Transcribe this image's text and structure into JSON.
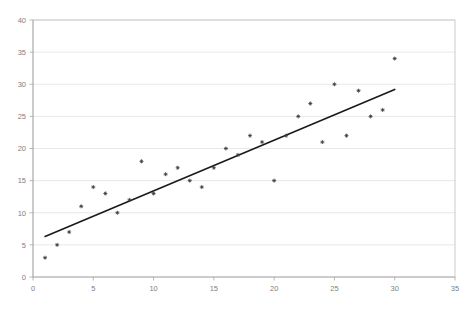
{
  "chart_data": {
    "type": "scatter",
    "title": "",
    "subtitle": "",
    "xlabel": "",
    "ylabel": "",
    "xlim": [
      0,
      35
    ],
    "ylim": [
      0,
      40
    ],
    "xticks": [
      0,
      5,
      10,
      15,
      20,
      25,
      30,
      35
    ],
    "yticks": [
      0,
      5,
      10,
      15,
      20,
      25,
      30,
      35,
      40
    ],
    "grid": "horizontal",
    "legend": "none",
    "marker_color": "#3a3a46",
    "trendline_color": "#1a1a1a",
    "gridline_color": "#d9d9d9",
    "axis_color": "#a6a6a6",
    "series": [
      {
        "name": "observations",
        "marker": "plus",
        "x": [
          1,
          2,
          3,
          4,
          5,
          6,
          7,
          8,
          9,
          10,
          11,
          12,
          13,
          14,
          15,
          16,
          17,
          18,
          19,
          20,
          21,
          22,
          23,
          24,
          25,
          26,
          27,
          28,
          29,
          30
        ],
        "y": [
          3,
          5,
          7,
          11,
          14,
          13,
          10,
          12,
          18,
          13,
          16,
          17,
          15,
          14,
          17,
          20,
          19,
          22,
          21,
          15,
          22,
          25,
          27,
          21,
          30,
          22,
          29,
          25,
          26,
          34
        ]
      }
    ],
    "trendline": {
      "type": "linear",
      "x_start": 1,
      "y_start": 6.3,
      "x_end": 30,
      "y_end": 29.2
    }
  },
  "axes": {
    "x_tick_labels": [
      "0",
      "5",
      "10",
      "15",
      "20",
      "25",
      "30",
      "35"
    ],
    "y_tick_labels": [
      "0",
      "5",
      "10",
      "15",
      "20",
      "25",
      "30",
      "35",
      "40"
    ]
  }
}
